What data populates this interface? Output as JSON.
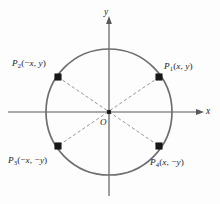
{
  "figure": {
    "background_color": "#fdfdfd",
    "axes": {
      "x_label": "x",
      "y_label": "x-axis-label-placeholder",
      "x_axis_name": "x",
      "y_axis_name": "y",
      "origin_label": "O",
      "axis_color": "#58585a"
    },
    "circle": {
      "center_x": 109,
      "center_y": 112,
      "radius": 63,
      "stroke_color": "#6e6e72"
    },
    "dashed_line_color": "#8b8b90",
    "point_marker_color": "#18181a",
    "points": [
      {
        "id": "P1",
        "name": "P",
        "subscript": "1",
        "coords_text": "(x, y)",
        "full_label": "P1(x, y)",
        "cx": 159,
        "cy": 77,
        "quadrant": "upper-right"
      },
      {
        "id": "P2",
        "name": "P",
        "subscript": "2",
        "coords_text": "(-x, y)",
        "full_label": "P2(-x, y)",
        "cx": 58,
        "cy": 77,
        "quadrant": "upper-left"
      },
      {
        "id": "P3",
        "name": "P",
        "subscript": "3",
        "coords_text": "(-x, -y)",
        "full_label": "P3(-x, -y)",
        "cx": 58,
        "cy": 146,
        "quadrant": "lower-left"
      },
      {
        "id": "P4",
        "name": "P",
        "subscript": "4",
        "coords_text": "(x, -y)",
        "full_label": "P4(x, -y)",
        "cx": 159,
        "cy": 146,
        "quadrant": "lower-right"
      }
    ],
    "labels": {
      "p1_p": "P",
      "p1_sub": "1",
      "p1_open": "(",
      "p1_x": "x",
      "p1_comma": ", ",
      "p1_y": "y",
      "p1_close": ")",
      "p2_p": "P",
      "p2_sub": "2",
      "p2_open": "(",
      "p2_neg": "−",
      "p2_x": "x",
      "p2_comma": ", ",
      "p2_y": "y",
      "p2_close": ")",
      "p3_p": "P",
      "p3_sub": "3",
      "p3_open": "(",
      "p3_neg1": "−",
      "p3_x": "x",
      "p3_comma": ", ",
      "p3_neg2": "−",
      "p3_y": "y",
      "p3_close": ")",
      "p4_p": "P",
      "p4_sub": "4",
      "p4_open": "(",
      "p4_x": "x",
      "p4_comma": ", ",
      "p4_neg": "−",
      "p4_y": "y",
      "p4_close": ")",
      "axis_x": "x",
      "axis_y": "y",
      "origin": "O"
    }
  }
}
